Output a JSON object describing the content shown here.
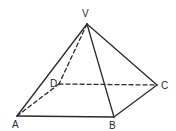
{
  "figure": {
    "type": "square-pyramid",
    "stroke_color": "#2a2a2a",
    "background": "#ffffff",
    "vertices": {
      "V": {
        "label": "V",
        "x": 87,
        "y": 24,
        "label_x": 82,
        "label_y": 17
      },
      "A": {
        "label": "A",
        "x": 17,
        "y": 116,
        "label_x": 12,
        "label_y": 128
      },
      "B": {
        "label": "B",
        "x": 114,
        "y": 117,
        "label_x": 109,
        "label_y": 129
      },
      "C": {
        "label": "C",
        "x": 157,
        "y": 85,
        "label_x": 161,
        "label_y": 89
      },
      "D": {
        "label": "D",
        "x": 59,
        "y": 84,
        "label_x": 50,
        "label_y": 87
      }
    },
    "solid_edges": [
      [
        "V",
        "A"
      ],
      [
        "V",
        "B"
      ],
      [
        "V",
        "C"
      ],
      [
        "A",
        "B"
      ],
      [
        "B",
        "C"
      ]
    ],
    "dashed_edges": [
      [
        "V",
        "D"
      ],
      [
        "A",
        "D"
      ],
      [
        "D",
        "C"
      ]
    ]
  }
}
